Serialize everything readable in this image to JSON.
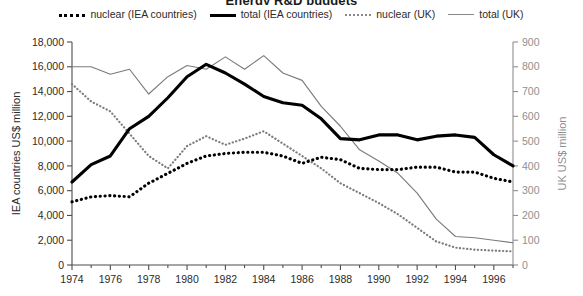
{
  "chart_data": {
    "type": "line",
    "title": "Energy R&D budgets",
    "xlabel": "",
    "ylabel": "IEA countries  US$ million",
    "y2label": "UK  US$ million",
    "ylim": [
      0,
      18000
    ],
    "y2lim": [
      0,
      900
    ],
    "xlim": [
      1974,
      1997
    ],
    "grid": false,
    "legend_position": "top-center",
    "x": [
      1974,
      1975,
      1976,
      1977,
      1978,
      1979,
      1980,
      1981,
      1982,
      1983,
      1984,
      1985,
      1986,
      1987,
      1988,
      1989,
      1990,
      1991,
      1992,
      1993,
      1994,
      1995,
      1996,
      1997
    ],
    "x_ticks": [
      "1974",
      "1976",
      "1978",
      "1980",
      "1982",
      "1984",
      "1986",
      "1988",
      "1990",
      "1992",
      "1994",
      "1996"
    ],
    "y_ticks": [
      "0",
      "2,000",
      "4,000",
      "6,000",
      "8,000",
      "10,000",
      "12,000",
      "14,000",
      "16,000",
      "18,000"
    ],
    "y2_ticks": [
      "0",
      "100",
      "200",
      "300",
      "400",
      "500",
      "600",
      "700",
      "800",
      "900"
    ],
    "series": [
      {
        "name": "nuclear (IEA countries)",
        "axis": "left",
        "style": "thick-dotted",
        "color": "#000000",
        "values": [
          5100,
          5500,
          5600,
          5500,
          6600,
          7400,
          8200,
          8800,
          9000,
          9100,
          9100,
          8800,
          8200,
          8700,
          8500,
          7800,
          7700,
          7700,
          7900,
          7900,
          7500,
          7500,
          7000,
          6700
        ]
      },
      {
        "name": "total (IEA countries)",
        "axis": "left",
        "style": "thick-solid",
        "color": "#000000",
        "values": [
          6700,
          8100,
          8800,
          11000,
          12000,
          13500,
          15200,
          16200,
          15500,
          14600,
          13600,
          13100,
          12900,
          11800,
          10200,
          10100,
          10500,
          10500,
          10100,
          10400,
          10500,
          10300,
          8900,
          8000
        ]
      },
      {
        "name": "nuclear (UK)",
        "axis": "right",
        "style": "thin-dotted",
        "color": "#7c7c7c",
        "values": [
          730,
          660,
          620,
          530,
          440,
          390,
          480,
          520,
          485,
          510,
          540,
          490,
          440,
          390,
          330,
          290,
          250,
          205,
          150,
          95,
          70,
          62,
          58,
          55
        ]
      },
      {
        "name": "total (UK)",
        "axis": "right",
        "style": "thin-solid",
        "color": "#7c7c7c",
        "values": [
          800,
          800,
          770,
          790,
          690,
          760,
          805,
          790,
          840,
          790,
          845,
          775,
          745,
          640,
          560,
          465,
          420,
          370,
          290,
          185,
          115,
          110,
          100,
          90
        ]
      }
    ]
  },
  "legend": {
    "items": [
      {
        "label": "nuclear (IEA countries)",
        "key": "thick-dotted-key"
      },
      {
        "label": "total (IEA countries)",
        "key": "thick-solid-key"
      },
      {
        "label": "nuclear (UK)",
        "key": "thin-dotted-key"
      },
      {
        "label": "total (UK)",
        "key": "thin-solid-key"
      }
    ]
  }
}
